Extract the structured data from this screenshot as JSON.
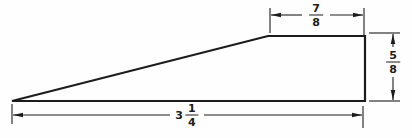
{
  "figure": {
    "type": "technical-drawing",
    "shape": "wedge",
    "line_color": "#1c1c1c",
    "background_color": "#fefefe",
    "labels": {
      "top_width": {
        "num": "7",
        "den": "8"
      },
      "right_height": {
        "num": "5",
        "den": "8"
      },
      "bottom_length": {
        "whole": "3",
        "num": "1",
        "den": "4"
      }
    }
  }
}
